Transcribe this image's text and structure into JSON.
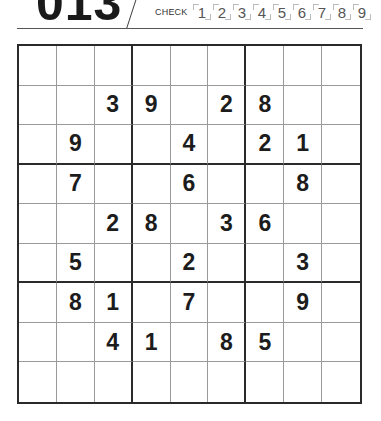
{
  "header": {
    "puzzle_number": "013",
    "check_label": "CHECK",
    "check_digits": [
      "1",
      "2",
      "3",
      "4",
      "5",
      "6",
      "7",
      "8",
      "9"
    ]
  },
  "grid": {
    "rows": [
      [
        "",
        "",
        "",
        "",
        "",
        "",
        "",
        "",
        ""
      ],
      [
        "",
        "",
        "3",
        "9",
        "",
        "2",
        "8",
        "",
        ""
      ],
      [
        "",
        "9",
        "",
        "",
        "4",
        "",
        "2",
        "1",
        ""
      ],
      [
        "",
        "7",
        "",
        "",
        "6",
        "",
        "",
        "8",
        ""
      ],
      [
        "",
        "",
        "2",
        "8",
        "",
        "3",
        "6",
        "",
        ""
      ],
      [
        "",
        "5",
        "",
        "",
        "2",
        "",
        "",
        "3",
        ""
      ],
      [
        "",
        "8",
        "1",
        "",
        "7",
        "",
        "",
        "9",
        ""
      ],
      [
        "",
        "",
        "4",
        "1",
        "",
        "8",
        "5",
        "",
        ""
      ],
      [
        "",
        "",
        "",
        "",
        "",
        "",
        "",
        "",
        ""
      ]
    ]
  }
}
